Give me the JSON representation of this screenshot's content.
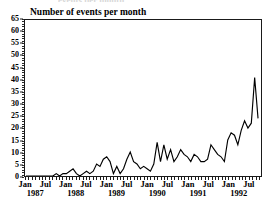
{
  "chart_data": {
    "type": "line",
    "title": "Number of events per month",
    "xlabel": "",
    "ylabel": "",
    "ylim": [
      0,
      65
    ],
    "ytick_step": 5,
    "yticks": [
      0,
      5,
      10,
      15,
      20,
      25,
      30,
      35,
      40,
      45,
      50,
      55,
      60,
      65
    ],
    "ytick_labels": [
      "0",
      "5",
      "10",
      "15",
      "20",
      "25",
      "30",
      "35",
      "40",
      "45",
      "50",
      "55",
      "60",
      "65"
    ],
    "grid": false,
    "legend": "none",
    "x_tick_frequency": "monthly",
    "x_label_months": [
      "Jan",
      "Jul",
      "Jan",
      "Jul",
      "Jan",
      "Jul",
      "Jan",
      "Jul",
      "Jan",
      "Jul",
      "Jan",
      "Jul"
    ],
    "x_label_years": [
      "1987",
      "1988",
      "1989",
      "1990",
      "1991",
      "1992"
    ],
    "x_start": "Jan 1987",
    "x_end": "Oct 1992",
    "x_labels": [
      "Jan 1987",
      "Feb 1987",
      "Mar 1987",
      "Apr 1987",
      "May 1987",
      "Jun 1987",
      "Jul 1987",
      "Aug 1987",
      "Sep 1987",
      "Oct 1987",
      "Nov 1987",
      "Dec 1987",
      "Jan 1988",
      "Feb 1988",
      "Mar 1988",
      "Apr 1988",
      "May 1988",
      "Jun 1988",
      "Jul 1988",
      "Aug 1988",
      "Sep 1988",
      "Oct 1988",
      "Nov 1988",
      "Dec 1988",
      "Jan 1989",
      "Feb 1989",
      "Mar 1989",
      "Apr 1989",
      "May 1989",
      "Jun 1989",
      "Jul 1989",
      "Aug 1989",
      "Sep 1989",
      "Oct 1989",
      "Nov 1989",
      "Dec 1989",
      "Jan 1990",
      "Feb 1990",
      "Mar 1990",
      "Apr 1990",
      "May 1990",
      "Jun 1990",
      "Jul 1990",
      "Aug 1990",
      "Sep 1990",
      "Oct 1990",
      "Nov 1990",
      "Dec 1990",
      "Jan 1991",
      "Feb 1991",
      "Mar 1991",
      "Apr 1991",
      "May 1991",
      "Jun 1991",
      "Jul 1991",
      "Aug 1991",
      "Sep 1991",
      "Oct 1991",
      "Nov 1991",
      "Dec 1991",
      "Jan 1992",
      "Feb 1992",
      "Mar 1992",
      "Apr 1992",
      "May 1992",
      "Jun 1992",
      "Jul 1992",
      "Aug 1992",
      "Sep 1992",
      "Oct 1992"
    ],
    "values": [
      0,
      0,
      0,
      0,
      0,
      0,
      0,
      0,
      0,
      1,
      0,
      1,
      1,
      2,
      3,
      1,
      0,
      1,
      2,
      1,
      2,
      5,
      4,
      7,
      8,
      6,
      1,
      4,
      1,
      3,
      7,
      10,
      6,
      5,
      3,
      4,
      3,
      2,
      5,
      14,
      6,
      13,
      7,
      11,
      6,
      8,
      11,
      9,
      8,
      6,
      9,
      8,
      6,
      6,
      7,
      13,
      11,
      9,
      8,
      6,
      15,
      18,
      17,
      13,
      19,
      23,
      20,
      22,
      41,
      24
    ],
    "peak_value": 41,
    "peak_label": "Jul 1992",
    "line_color": "#000000",
    "axis_color": "#1a1a1a",
    "background_color": "#ffffff"
  },
  "ghost_caption": "events per month"
}
